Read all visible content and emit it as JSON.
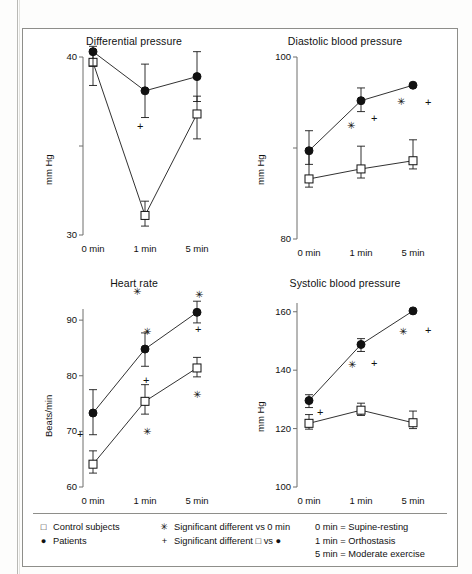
{
  "figure": {
    "panels": [
      {
        "id": "differential-pressure",
        "title": "Differential pressure",
        "ylabel": "mm Hg",
        "yticks": [
          "40",
          "30"
        ],
        "xticks": [
          "0 min",
          "1 min",
          "5 min"
        ]
      },
      {
        "id": "diastolic-blood-pressure",
        "title": "Diastolic blood pressure",
        "ylabel": "mm Hg",
        "yticks": [
          "100",
          "80"
        ],
        "xticks": [
          "0 min",
          "1 min",
          "5 min"
        ]
      },
      {
        "id": "heart-rate",
        "title": "Heart rate",
        "ylabel": "Beats/min",
        "yticks": [
          "90",
          "80",
          "70",
          "60"
        ],
        "xticks": [
          "0 min",
          "1 min",
          "5 min"
        ]
      },
      {
        "id": "systolic-blood-pressure",
        "title": "Systolic blood pressure",
        "ylabel": "mm Hg",
        "yticks": [
          "160",
          "140",
          "120",
          "100"
        ],
        "xticks": [
          "0 min",
          "1 min",
          "5 min"
        ]
      }
    ]
  },
  "legend": {
    "series": [
      {
        "symbol": "□",
        "label": "Control subjects"
      },
      {
        "symbol": "●",
        "label": "Patients"
      }
    ],
    "significance": [
      {
        "symbol": "✳",
        "label": "Significant different vs 0 min"
      },
      {
        "symbol": "+",
        "label": "Significant different □ vs ●"
      }
    ],
    "conditions": [
      "0 min = Supine-resting",
      "1 min = Orthostasis",
      "5 min = Moderate exercise"
    ]
  },
  "chart_data": [
    {
      "type": "line",
      "id": "differential-pressure",
      "title": "Differential pressure",
      "xlabel": "",
      "ylabel": "mm Hg",
      "categories": [
        "0 min",
        "1 min",
        "5 min"
      ],
      "ylim": [
        30,
        40
      ],
      "yticks": [
        30,
        35,
        40
      ],
      "ytick_labels": [
        "30",
        "",
        "40"
      ],
      "grid": false,
      "legend_position": "bottom-external",
      "series": [
        {
          "name": "Control subjects",
          "marker": "open-square",
          "values": [
            39.7,
            31.1,
            36.8
          ],
          "err_low": [
            1.3,
            0.6,
            1.4
          ],
          "err_high": [
            0.7,
            0.8,
            1.0
          ]
        },
        {
          "name": "Patients",
          "marker": "filled-circle",
          "values": [
            40.3,
            38.1,
            38.9
          ],
          "err_low": [
            0.8,
            1.5,
            1.4
          ],
          "err_high": [
            0.3,
            1.5,
            1.4
          ]
        }
      ],
      "annotations": [
        {
          "symbol": "✳",
          "series": "Control subjects",
          "category": "1 min"
        },
        {
          "symbol": "+",
          "series": "Patients",
          "category": "1 min"
        }
      ]
    },
    {
      "type": "line",
      "id": "diastolic-blood-pressure",
      "title": "Diastolic blood pressure",
      "xlabel": "",
      "ylabel": "mm Hg",
      "categories": [
        "0 min",
        "1 min",
        "5 min"
      ],
      "ylim": [
        80,
        100
      ],
      "yticks": [
        80,
        90,
        100
      ],
      "ytick_labels": [
        "80",
        "",
        "100"
      ],
      "grid": false,
      "legend_position": "bottom-external",
      "series": [
        {
          "name": "Control subjects",
          "marker": "open-square",
          "values": [
            86.6,
            87.7,
            88.6
          ],
          "err_low": [
            0.9,
            1.0,
            0.9
          ],
          "err_high": [
            3.3,
            2.5,
            2.3
          ]
        },
        {
          "name": "Patients",
          "marker": "filled-circle",
          "values": [
            89.7,
            95.2,
            96.9
          ],
          "err_low": [
            1.5,
            1.2,
            0.0
          ],
          "err_high": [
            2.2,
            1.4,
            0.0
          ]
        }
      ],
      "annotations": [
        {
          "symbol": "✳",
          "series": "Patients",
          "category": "1 min"
        },
        {
          "symbol": "+",
          "series": "Patients",
          "category": "1 min"
        },
        {
          "symbol": "✳",
          "series": "Patients",
          "category": "5 min"
        },
        {
          "symbol": "+",
          "series": "Patients",
          "category": "5 min"
        }
      ]
    },
    {
      "type": "line",
      "id": "heart-rate",
      "title": "Heart rate",
      "xlabel": "",
      "ylabel": "Beats/min",
      "categories": [
        "0 min",
        "1 min",
        "5 min"
      ],
      "ylim": [
        60,
        92
      ],
      "yticks": [
        60,
        70,
        80,
        90
      ],
      "ytick_labels": [
        "60",
        "70",
        "80",
        "90"
      ],
      "grid": false,
      "legend_position": "bottom-external",
      "series": [
        {
          "name": "Control subjects",
          "marker": "open-square",
          "values": [
            64.1,
            75.4,
            81.4
          ],
          "err_low": [
            1.6,
            2.3,
            1.6
          ],
          "err_high": [
            2.4,
            3.0,
            1.9
          ]
        },
        {
          "name": "Patients",
          "marker": "filled-circle",
          "values": [
            73.3,
            84.8,
            91.4
          ],
          "err_low": [
            3.9,
            3.1,
            1.9
          ],
          "err_high": [
            4.2,
            2.9,
            2.0
          ]
        }
      ],
      "annotations": [
        {
          "symbol": "+",
          "series": "Patients",
          "category": "0 min"
        },
        {
          "symbol": "✳",
          "series": "Patients",
          "category": "1 min"
        },
        {
          "symbol": "+",
          "series": "Patients",
          "category": "1 min"
        },
        {
          "symbol": "✳",
          "series": "Control subjects",
          "category": "1 min"
        },
        {
          "symbol": "✳",
          "series": "Patients",
          "category": "5 min"
        },
        {
          "symbol": "+",
          "series": "Patients",
          "category": "5 min"
        },
        {
          "symbol": "✳",
          "series": "Control subjects",
          "category": "5 min"
        }
      ]
    },
    {
      "type": "line",
      "id": "systolic-blood-pressure",
      "title": "Systolic blood pressure",
      "xlabel": "",
      "ylabel": "mm Hg",
      "categories": [
        "0 min",
        "1 min",
        "5 min"
      ],
      "ylim": [
        100,
        163
      ],
      "yticks": [
        100,
        120,
        140,
        160
      ],
      "ytick_labels": [
        "100",
        "120",
        "140",
        "160"
      ],
      "grid": false,
      "legend_position": "bottom-external",
      "series": [
        {
          "name": "Control subjects",
          "marker": "open-square",
          "values": [
            121.8,
            126.3,
            122.0
          ],
          "err_low": [
            2.0,
            1.8,
            2.0
          ],
          "err_high": [
            3.0,
            2.4,
            4.0
          ]
        },
        {
          "name": "Patients",
          "marker": "filled-circle",
          "values": [
            129.6,
            148.8,
            160.3
          ],
          "err_low": [
            2.4,
            2.4,
            0.0
          ],
          "err_high": [
            2.0,
            2.0,
            0.0
          ]
        }
      ],
      "annotations": [
        {
          "symbol": "+",
          "series": "Patients",
          "category": "0 min"
        },
        {
          "symbol": "✳",
          "series": "Patients",
          "category": "1 min"
        },
        {
          "symbol": "+",
          "series": "Patients",
          "category": "1 min"
        },
        {
          "symbol": "✳",
          "series": "Patients",
          "category": "5 min"
        },
        {
          "symbol": "+",
          "series": "Patients",
          "category": "5 min"
        }
      ]
    }
  ]
}
